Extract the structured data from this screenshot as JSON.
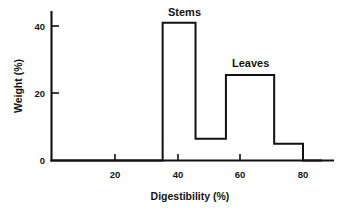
{
  "chart_data": {
    "type": "area",
    "title": "",
    "xlabel": "Digestibility (%)",
    "ylabel": "Weight (%)",
    "xlim": [
      0,
      86
    ],
    "ylim": [
      0,
      47
    ],
    "grid": false,
    "legend": "none",
    "x_ticks": [
      20,
      40,
      60,
      80
    ],
    "x_tick_labels": [
      "20",
      "40",
      "60",
      "80"
    ],
    "y_ticks": [
      0,
      20,
      40
    ],
    "y_tick_labels": [
      "0",
      "20",
      "40"
    ],
    "annotations": [
      {
        "text": "Stems",
        "x": 40.5,
        "y": 45.5
      },
      {
        "text": "Leaves",
        "x": 63.0,
        "y": 30.0
      }
    ],
    "steps": [
      {
        "x_start": 0.0,
        "x_end": 35.2,
        "value": 0
      },
      {
        "x_start": 35.2,
        "x_end": 45.7,
        "value": 41
      },
      {
        "x_start": 45.7,
        "x_end": 55.4,
        "value": 6.5
      },
      {
        "x_start": 55.4,
        "x_end": 70.8,
        "value": 25.4
      },
      {
        "x_start": 70.8,
        "x_end": 80.0,
        "value": 5.0
      },
      {
        "x_start": 80.0,
        "x_end": 86.0,
        "value": 0
      }
    ],
    "series": [
      {
        "name": "weight-distribution",
        "x": [
          0,
          35.2,
          35.2,
          45.7,
          45.7,
          55.4,
          55.4,
          70.8,
          70.8,
          80.0,
          80.0,
          86.0
        ],
        "values": [
          0,
          0,
          41,
          41,
          6.5,
          6.5,
          25.4,
          25.4,
          5.0,
          5.0,
          0,
          0
        ]
      }
    ]
  },
  "axes": {
    "y_axis_title": "Weight (%)",
    "x_axis_title": "Digestibility (%)",
    "y_tick_labels": [
      "40",
      "20",
      "0"
    ],
    "x_tick_labels": [
      "20",
      "40",
      "60",
      "80"
    ]
  },
  "labels": {
    "stems": "Stems",
    "leaves": "Leaves"
  },
  "colors": {
    "line": "#111111",
    "text": "#141414",
    "background": "#ffffff"
  }
}
